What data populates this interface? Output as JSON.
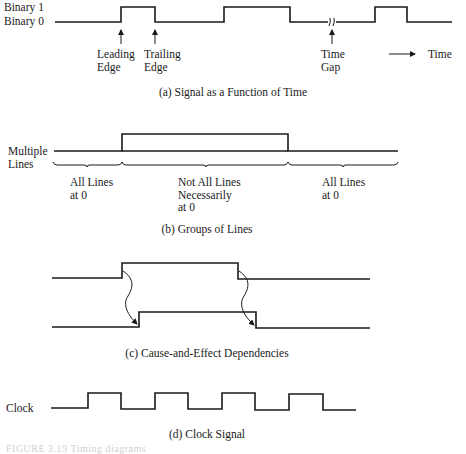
{
  "panel_a": {
    "labels": {
      "binary1": "Binary 1",
      "binary0": "Binary 0",
      "leading_edge": "Leading\nEdge",
      "trailing_edge": "Trailing\nEdge",
      "time_gap": "Time\nGap",
      "time_axis": "Time"
    },
    "caption": "(a) Signal as a Function of Time"
  },
  "panel_b": {
    "label": "Multiple\nLines",
    "regions": [
      "All Lines\nat 0",
      "Not All Lines\nNecessarily\nat 0",
      "All Lines\nat 0"
    ],
    "caption": "(b) Groups of Lines"
  },
  "panel_c": {
    "caption": "(c) Cause-and-Effect Dependencies"
  },
  "panel_d": {
    "label": "Clock",
    "caption": "(d) Clock Signal"
  },
  "figure_caption": "FIGURE 3.19   Timing diagrams"
}
